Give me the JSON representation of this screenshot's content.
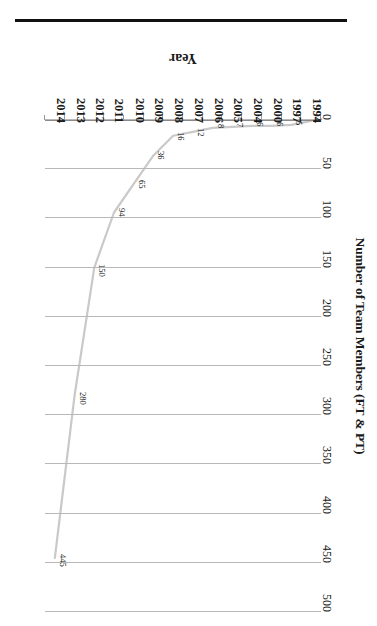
{
  "chart_data": {
    "type": "line",
    "title": "",
    "xlabel": "Year",
    "ylabel": "Number of Team Members (FT & PT)",
    "categories": [
      "1994",
      "1997",
      "2000",
      "2004",
      "2005",
      "2006",
      "2007",
      "2008",
      "2009",
      "2010",
      "2011",
      "2012",
      "2013",
      "2014"
    ],
    "values": [
      1,
      5,
      6,
      6,
      7,
      8,
      12,
      16,
      36,
      65,
      94,
      150,
      280,
      445
    ],
    "point_labels": [
      "1",
      "5",
      "6",
      "6",
      "7",
      "8",
      "12",
      "16",
      "36",
      "65",
      "94",
      "150",
      "280",
      "445"
    ],
    "ytick_labels": [
      "0",
      "50",
      "100",
      "150",
      "200",
      "250",
      "300",
      "350",
      "400",
      "450",
      "500"
    ],
    "ytick_values": [
      0,
      50,
      100,
      150,
      200,
      250,
      300,
      350,
      400,
      450,
      500
    ],
    "ylim": [
      0,
      500
    ],
    "grid": true,
    "legend": "none",
    "series": [
      {
        "name": "Number of Team Members (FT & PT)",
        "values": [
          1,
          5,
          6,
          6,
          7,
          8,
          12,
          16,
          36,
          65,
          94,
          150,
          280,
          445
        ],
        "color": "#c9c9c9"
      }
    ],
    "orientation": "rotated-180",
    "colors": {
      "line": "#c9c9c9",
      "gridline": "#b8b8b8",
      "axis": "#8a8a8a",
      "text": "#111111",
      "background": "#ffffff"
    }
  }
}
